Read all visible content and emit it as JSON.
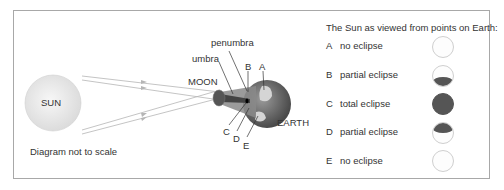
{
  "diagram": {
    "sun_label": "SUN",
    "moon_label": "MOON",
    "earth_label": "EARTH",
    "umbra_label": "umbra",
    "penumbra_label": "penumbra",
    "note": "Diagram not to scale",
    "points": [
      "A",
      "B",
      "C",
      "D",
      "E"
    ]
  },
  "legend": {
    "title": "The Sun as viewed from points on Earth:",
    "rows": [
      {
        "letter": "A",
        "label": "no eclipse",
        "coverage": "none"
      },
      {
        "letter": "B",
        "label": "partial eclipse",
        "coverage": "bottom-half"
      },
      {
        "letter": "C",
        "label": "total eclipse",
        "coverage": "full"
      },
      {
        "letter": "D",
        "label": "partial eclipse",
        "coverage": "top-half"
      },
      {
        "letter": "E",
        "label": "no eclipse",
        "coverage": "none"
      }
    ]
  },
  "colors": {
    "shadow": "#555555",
    "sun_fill": "#eeeeee",
    "earth_dark": "#666666",
    "earth_light": "#dddddd"
  }
}
